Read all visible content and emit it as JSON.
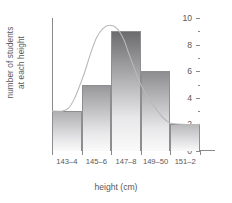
{
  "chart_data": {
    "type": "bar",
    "title": "",
    "xlabel": "height (cm)",
    "ylabel_line1": "number of students",
    "ylabel_line2": "at each height",
    "categories": [
      "143–4",
      "145–6",
      "147–8",
      "149–50",
      "151–2"
    ],
    "values": [
      3,
      5,
      9,
      6,
      2
    ],
    "ylim": [
      0,
      10
    ],
    "ytick_labels": [
      "0",
      "2",
      "4",
      "6",
      "8",
      "10"
    ],
    "ytick_values": [
      0,
      2,
      4,
      6,
      8,
      10
    ],
    "yminor_values": [
      1,
      3,
      5,
      7,
      9
    ],
    "grid": false,
    "legend": "none",
    "overlay": {
      "type": "line",
      "name": "frequency curve",
      "color": "#b9b9bb",
      "points": [
        [
          0.0,
          3.0
        ],
        [
          0.35,
          3.0
        ],
        [
          0.55,
          3.2
        ],
        [
          0.75,
          3.9
        ],
        [
          0.95,
          5.0
        ],
        [
          1.1,
          5.9
        ],
        [
          1.3,
          7.3
        ],
        [
          1.5,
          8.5
        ],
        [
          1.72,
          9.2
        ],
        [
          1.95,
          9.45
        ],
        [
          2.2,
          9.2
        ],
        [
          2.42,
          8.4
        ],
        [
          2.6,
          7.3
        ],
        [
          2.8,
          6.1
        ],
        [
          3.0,
          5.0
        ],
        [
          3.25,
          4.0
        ],
        [
          3.5,
          3.2
        ],
        [
          3.75,
          2.5
        ],
        [
          4.0,
          2.1
        ],
        [
          4.4,
          2.0
        ],
        [
          5.0,
          2.0
        ]
      ]
    },
    "colors": {
      "bar_border": "#8e8e90",
      "axis": "#8a8a8c",
      "text": "#58585a",
      "curve": "#b9b9bb",
      "background": "#ffffff",
      "bar_top_light": "#cfcfd1",
      "bar_top_dark": "#6e6e70"
    }
  }
}
